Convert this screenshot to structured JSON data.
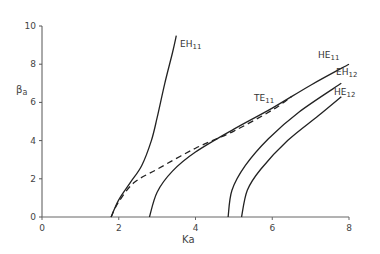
{
  "chart_data": {
    "type": "line",
    "title": "",
    "xlabel": "Ka",
    "ylabel": "βa",
    "xlim": [
      0,
      8
    ],
    "ylim": [
      0,
      10
    ],
    "x_ticks": [
      "0",
      "2",
      "4",
      "6",
      "8"
    ],
    "y_ticks": [
      "0",
      "2",
      "4",
      "6",
      "8",
      "10"
    ],
    "grid": false,
    "legend": "inline curve labels",
    "series": [
      {
        "name": "EH11",
        "label_main": "EH",
        "label_sub": "11",
        "style": "solid",
        "x": [
          1.8,
          2.0,
          2.3,
          2.6,
          2.85,
          3.0,
          3.2,
          3.4,
          3.5
        ],
        "y": [
          0.0,
          0.9,
          1.8,
          2.7,
          4.0,
          5.2,
          7.0,
          8.6,
          9.5
        ]
      },
      {
        "name": "TE11",
        "label_main": "TE",
        "label_sub": "11",
        "style": "dashed",
        "x": [
          1.8,
          2.0,
          2.4,
          3.0,
          4.0,
          5.0,
          6.0,
          6.5
        ],
        "y": [
          0.0,
          0.8,
          1.8,
          2.5,
          3.6,
          4.5,
          5.6,
          6.3
        ]
      },
      {
        "name": "HE11",
        "label_main": "HE",
        "label_sub": "11",
        "style": "solid",
        "x": [
          2.8,
          3.0,
          3.4,
          4.0,
          5.0,
          6.0,
          7.0,
          8.0
        ],
        "y": [
          0.0,
          1.3,
          2.4,
          3.4,
          4.6,
          5.7,
          6.9,
          8.0
        ]
      },
      {
        "name": "EH12",
        "label_main": "EH",
        "label_sub": "12",
        "style": "solid",
        "x": [
          4.85,
          4.95,
          5.3,
          5.9,
          6.7,
          7.8
        ],
        "y": [
          0.0,
          1.4,
          2.7,
          4.1,
          5.5,
          7.0
        ]
      },
      {
        "name": "HE12",
        "label_main": "HE",
        "label_sub": "12",
        "style": "solid",
        "x": [
          5.2,
          5.35,
          5.7,
          6.4,
          7.2,
          7.8
        ],
        "y": [
          0.0,
          1.4,
          2.5,
          4.0,
          5.3,
          6.3
        ]
      }
    ]
  }
}
